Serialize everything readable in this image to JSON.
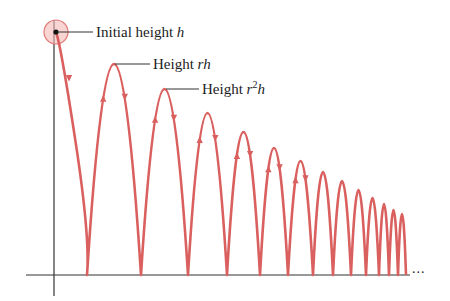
{
  "figure": {
    "colors": {
      "curve": "#d9605f",
      "axis": "#333333",
      "highlight_fill": "#f4b9b6",
      "highlight_stroke": "#e07c79",
      "text": "#222222"
    },
    "labels": {
      "initial": {
        "prefix": "Initial height ",
        "var": "h"
      },
      "first": {
        "prefix": "Height ",
        "var": "rh"
      },
      "second": {
        "prefix": "Height ",
        "var_base": "r",
        "var_exp": "2",
        "var_tail": "h"
      }
    },
    "ellipsis": "...",
    "bounces": {
      "baseline_y": 275,
      "start": {
        "x": 56,
        "y": 32
      },
      "landings_x": [
        87,
        141,
        188,
        227,
        260,
        288,
        313,
        333,
        351,
        366,
        379,
        389,
        398,
        406
      ],
      "peaks": [
        {
          "x": 114,
          "y": 64
        },
        {
          "x": 165,
          "y": 89
        },
        {
          "x": 208,
          "y": 113
        },
        {
          "x": 244,
          "y": 132
        },
        {
          "x": 275,
          "y": 148
        },
        {
          "x": 301,
          "y": 161
        },
        {
          "x": 323,
          "y": 172
        },
        {
          "x": 342,
          "y": 181
        },
        {
          "x": 359,
          "y": 190
        },
        {
          "x": 373,
          "y": 198
        },
        {
          "x": 384,
          "y": 204
        },
        {
          "x": 394,
          "y": 210
        },
        {
          "x": 402,
          "y": 214
        }
      ]
    }
  }
}
